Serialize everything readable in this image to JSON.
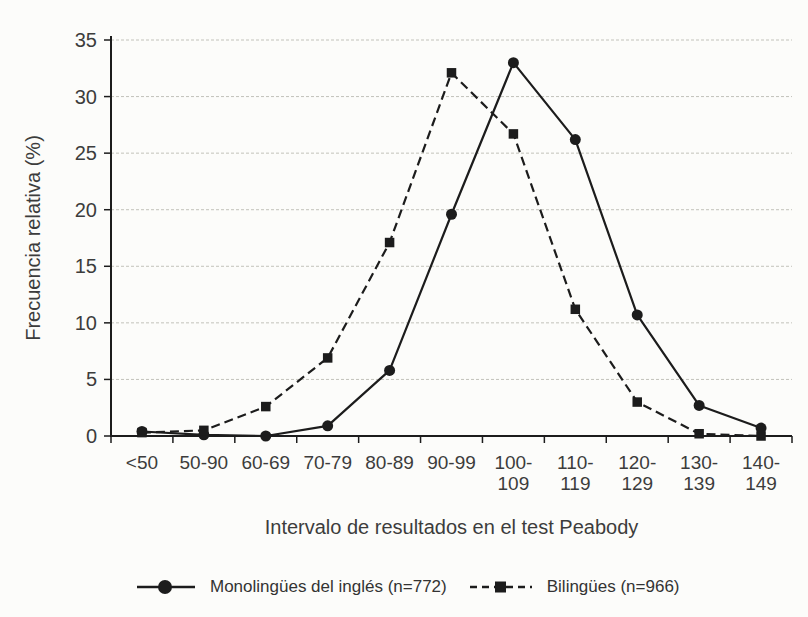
{
  "chart_data": {
    "type": "line",
    "title": "",
    "xlabel": "Intervalo de resultados en el test Peabody",
    "ylabel": "Frecuencia relativa (%)",
    "ylim": [
      0,
      35
    ],
    "yticks": [
      0,
      5,
      10,
      15,
      20,
      25,
      30,
      35
    ],
    "grid": "horizontal",
    "legend_position": "bottom",
    "categories": [
      "<50",
      "50-90",
      "60-69",
      "70-79",
      "80-89",
      "90-99",
      "100-\n109",
      "110-\n119",
      "120-\n129",
      "130-\n139",
      "140-\n149"
    ],
    "series": [
      {
        "name": "Monolingües del inglés (n=772)",
        "marker": "circle",
        "line": "solid",
        "values": [
          0.4,
          0.1,
          0,
          0.9,
          5.8,
          19.6,
          33.0,
          26.2,
          10.7,
          2.7,
          0.7
        ]
      },
      {
        "name": "Bilingües (n=966)",
        "marker": "square",
        "line": "dashed",
        "values": [
          0.3,
          0.5,
          2.6,
          6.9,
          17.1,
          32.1,
          26.7,
          11.2,
          3.0,
          0.2,
          0
        ]
      }
    ],
    "colors": {
      "ink": "#1c1c1c",
      "grid": "#c2c2ba",
      "text": "#3c3c3c",
      "background": "#fcfcfa"
    }
  }
}
